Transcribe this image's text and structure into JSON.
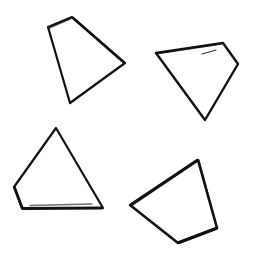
{
  "canvas": {
    "width": 256,
    "height": 270,
    "background_color": "#ffffff",
    "ink_color": "#111111",
    "description": "Four hand-drawn black-ink quadrilateral outlines on a plain white background"
  },
  "shapes": [
    {
      "name": "quadrilateral-top-left",
      "label": "top-left quadrilateral",
      "closed": true,
      "stroke_color": "#111111",
      "stroke_width": 2.2,
      "points": "48,27 72,17 125,63 70,103",
      "vertices": [
        {
          "x": 48,
          "y": 27
        },
        {
          "x": 72,
          "y": 17
        },
        {
          "x": 125,
          "y": 63
        },
        {
          "x": 70,
          "y": 103
        }
      ]
    },
    {
      "name": "quadrilateral-top-right",
      "label": "top-right quadrilateral",
      "closed": true,
      "stroke_color": "#111111",
      "stroke_width": 2.4,
      "points": "156,53 223,43 238,64 205,120",
      "vertices": [
        {
          "x": 156,
          "y": 53
        },
        {
          "x": 223,
          "y": 43
        },
        {
          "x": 238,
          "y": 64
        },
        {
          "x": 205,
          "y": 120
        }
      ]
    },
    {
      "name": "quadrilateral-bottom-left",
      "label": "bottom-left quadrilateral",
      "closed": true,
      "stroke_color": "#111111",
      "stroke_width": 2.2,
      "points": "56,128 103,208 22,208 14,187",
      "vertices": [
        {
          "x": 56,
          "y": 128
        },
        {
          "x": 103,
          "y": 208
        },
        {
          "x": 22,
          "y": 208
        },
        {
          "x": 14,
          "y": 187
        }
      ]
    },
    {
      "name": "quadrilateral-bottom-right",
      "label": "bottom-right quadrilateral",
      "closed": true,
      "stroke_color": "#111111",
      "stroke_width": 2.6,
      "points": "198,160 217,228 178,243 130,205",
      "vertices": [
        {
          "x": 198,
          "y": 160
        },
        {
          "x": 217,
          "y": 228
        },
        {
          "x": 178,
          "y": 243
        },
        {
          "x": 130,
          "y": 205
        }
      ]
    }
  ],
  "stray_marks": [
    {
      "name": "stray-tick-top-right",
      "label": "short stray pen tick inside top-right shape",
      "stroke_color": "#2a2a2a",
      "stroke_width": 1.1,
      "path": "M 202,54 L 216,50"
    }
  ]
}
